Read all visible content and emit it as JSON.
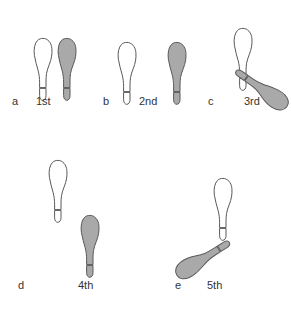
{
  "figure": {
    "width": 291,
    "height": 309,
    "background_color": "#ffffff",
    "outline_color": "#595959",
    "shaded_fill_color": "#a9a9a9",
    "unshaded_fill_color": "#ffffff",
    "label_color": "#333333"
  },
  "panels": [
    {
      "letter": "a",
      "ordinal": "1st",
      "letter_x": 12,
      "letter_y": 105,
      "ordinal_x": 36,
      "ordinal_y": 105,
      "shoes": [
        {
          "name": "left-shoe-unshaded",
          "fill": "unshaded",
          "x": 33,
          "y": 38,
          "rotation": 0,
          "scale": 1.0
        },
        {
          "name": "right-shoe-shaded",
          "fill": "shaded",
          "x": 57,
          "y": 38,
          "rotation": 0,
          "scale": 1.0
        }
      ]
    },
    {
      "letter": "b",
      "ordinal": "2nd",
      "letter_x": 103,
      "letter_y": 105,
      "ordinal_x": 139,
      "ordinal_y": 105,
      "shoes": [
        {
          "name": "left-shoe-unshaded",
          "fill": "unshaded",
          "x": 117,
          "y": 42,
          "rotation": 0,
          "scale": 1.0
        },
        {
          "name": "right-shoe-shaded",
          "fill": "shaded",
          "x": 167,
          "y": 42,
          "rotation": 0,
          "scale": 1.0
        }
      ]
    },
    {
      "letter": "c",
      "ordinal": "3rd",
      "letter_x": 208,
      "letter_y": 105,
      "ordinal_x": 244,
      "ordinal_y": 105,
      "shoes": [
        {
          "name": "left-shoe-unshaded",
          "fill": "unshaded",
          "x": 233,
          "y": 28,
          "rotation": 0,
          "scale": 1.0
        },
        {
          "name": "right-shoe-shaded",
          "fill": "shaded",
          "x": 252,
          "y": 58,
          "rotation": 125,
          "scale": 1.0
        }
      ]
    },
    {
      "letter": "d",
      "ordinal": "4th",
      "letter_x": 18,
      "letter_y": 289,
      "ordinal_x": 78,
      "ordinal_y": 289,
      "shoes": [
        {
          "name": "left-shoe-unshaded",
          "fill": "unshaded",
          "x": 48,
          "y": 160,
          "rotation": 0,
          "scale": 1.0
        },
        {
          "name": "right-shoe-shaded",
          "fill": "shaded",
          "x": 80,
          "y": 215,
          "rotation": 0,
          "scale": 1.0
        }
      ]
    },
    {
      "letter": "e",
      "ordinal": "5th",
      "letter_x": 175,
      "letter_y": 289,
      "ordinal_x": 207,
      "ordinal_y": 289,
      "shoes": [
        {
          "name": "left-shoe-unshaded",
          "fill": "unshaded",
          "x": 213,
          "y": 178,
          "rotation": 0,
          "scale": 1.0
        },
        {
          "name": "right-shoe-shaded",
          "fill": "shaded",
          "x": 193,
          "y": 228,
          "rotation": -122,
          "scale": 1.0
        }
      ]
    }
  ]
}
